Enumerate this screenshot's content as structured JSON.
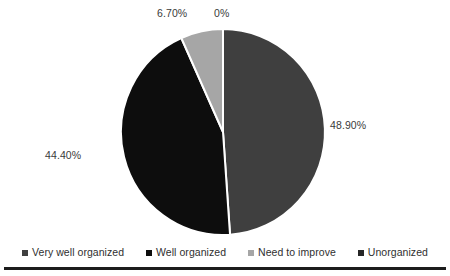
{
  "chart_data": {
    "type": "pie",
    "title": "",
    "subtitle": "",
    "xlabel": "",
    "ylabel": "",
    "grid": false,
    "legend_position": "bottom",
    "start_angle_deg": 0,
    "direction": "clockwise",
    "categories": [
      "Very well organized",
      "Well organized",
      "Need to improve",
      "Unorganized"
    ],
    "values": [
      48.9,
      44.4,
      6.7,
      0
    ],
    "value_labels": [
      "48.90%",
      "44.40%",
      "6.70%",
      "0%"
    ],
    "colors": [
      "#3f3f3f",
      "#0d0d0d",
      "#a6a6a6",
      "#262626"
    ],
    "slice_separator_color": "#ffffff",
    "slices": [
      {
        "name": "Very well organized",
        "value": 48.9,
        "label": "48.90%",
        "color": "#3f3f3f"
      },
      {
        "name": "Well organized",
        "value": 44.4,
        "label": "44.40%",
        "color": "#0d0d0d"
      },
      {
        "name": "Need to improve",
        "value": 6.7,
        "label": "6.70%",
        "color": "#a6a6a6"
      },
      {
        "name": "Unorganized",
        "value": 0,
        "label": "0%",
        "color": "#262626"
      }
    ]
  },
  "labels": {
    "very_well_organized": "48.90%",
    "well_organized": "44.40%",
    "need_to_improve": "6.70%",
    "unorganized": "0%"
  },
  "legend": {
    "items": [
      {
        "label": "Very well organized",
        "color": "#3f3f3f"
      },
      {
        "label": "Well organized",
        "color": "#0d0d0d"
      },
      {
        "label": "Need to improve",
        "color": "#a6a6a6"
      },
      {
        "label": "Unorganized",
        "color": "#262626"
      }
    ]
  },
  "style": {
    "background": "#ffffff",
    "text_color": "#2f2f2f",
    "rule_color": "#1c1c1c"
  }
}
